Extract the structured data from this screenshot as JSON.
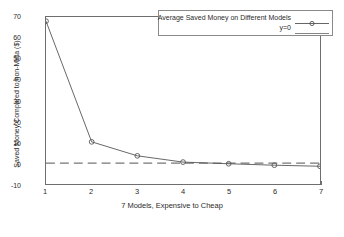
{
  "chart_data": {
    "type": "line",
    "title": "",
    "xlabel": "7 Models, Expensive to Cheap",
    "ylabel": "Saved Money Compared to non-Meta ($)",
    "x": [
      1,
      2,
      3,
      4,
      5,
      6,
      7
    ],
    "series": [
      {
        "name": "Average Saved Money on Different Models",
        "values": [
          68,
          10.2,
          3.5,
          0.5,
          -0.3,
          -1.0,
          -1.5
        ],
        "marker": "circle",
        "color": "#555555"
      },
      {
        "name": "y=0",
        "values": [
          0,
          0,
          0,
          0,
          0,
          0,
          0
        ],
        "marker": "none",
        "style": "dashed",
        "color": "#777777"
      }
    ],
    "xlim": [
      1,
      7
    ],
    "ylim": [
      -10,
      70
    ],
    "xticks": [
      "1",
      "2",
      "3",
      "4",
      "5",
      "6",
      "7"
    ],
    "yticks": [
      "-10",
      "0",
      "10",
      "20",
      "30",
      "40",
      "50",
      "60",
      "70"
    ],
    "grid": false,
    "legend_position": "top-right"
  },
  "legend": {
    "entries": [
      {
        "label": "Average Saved Money on Different Models"
      },
      {
        "label": "y=0"
      }
    ]
  },
  "axes": {
    "y_label": "Saved Money Compared to non-Meta ($)",
    "x_label": "7 Models, Expensive to Cheap",
    "y_ticks": [
      "70",
      "60",
      "50",
      "40",
      "30",
      "20",
      "10",
      "0",
      "-10"
    ],
    "x_ticks": [
      "1",
      "2",
      "3",
      "4",
      "5",
      "6",
      "7"
    ]
  },
  "colors": {
    "axis": "#6e6e6e",
    "series": "#555555",
    "zero_line": "#777777",
    "background": "#ffffff"
  }
}
